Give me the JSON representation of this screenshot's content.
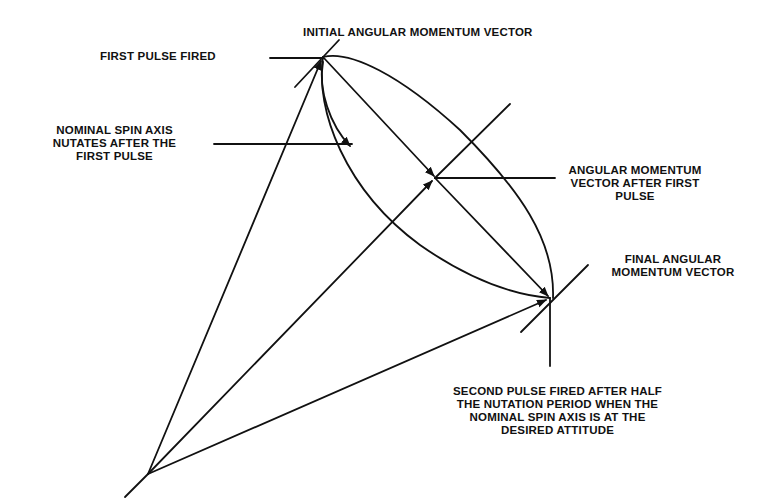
{
  "diagram": {
    "type": "vector-geometry",
    "topic": "spin-axis nutation between two pulses",
    "colors": {
      "line": "#111111",
      "background": "#ffffff"
    },
    "labels": {
      "initial_vector": "INITIAL ANGULAR MOMENTUM VECTOR",
      "first_pulse": "FIRST PULSE FIRED",
      "nutation": [
        "NOMINAL SPIN AXIS",
        "NUTATES AFTER THE",
        "FIRST PULSE"
      ],
      "after_first": [
        "ANGULAR MOMENTUM",
        "VECTOR AFTER FIRST",
        "PULSE"
      ],
      "final_vector": [
        "FINAL ANGULAR",
        "MOMENTUM VECTOR"
      ],
      "second_pulse": [
        "SECOND PULSE FIRED AFTER HALF",
        "THE NUTATION PERIOD WHEN THE",
        "NOMINAL SPIN AXIS IS AT THE",
        "DESIRED ATTITUDE"
      ]
    },
    "points": {
      "apex": [
        148,
        474
      ],
      "initial": [
        323,
        57
      ],
      "after_first": [
        435,
        178
      ],
      "final": [
        550,
        298
      ]
    }
  }
}
